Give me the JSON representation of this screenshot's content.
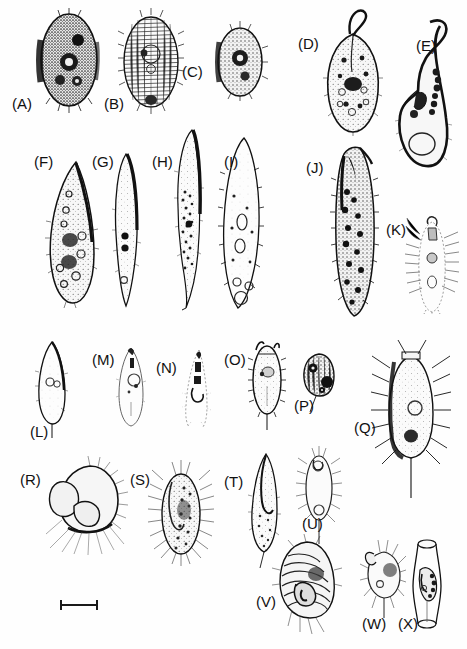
{
  "plate": {
    "title": "Plate of ciliate and flagellate protozoan line drawings",
    "caption": "",
    "background_color": "#ffffff",
    "ink_color": "#1a1a1a",
    "width": 467,
    "height": 649,
    "panel_count": 24
  },
  "scale_bar": {
    "name": "scale-bar",
    "x": 60,
    "y": 604,
    "length": 38,
    "label": ""
  },
  "panels": [
    {
      "id": "A",
      "label": "(A)",
      "label_x": 12,
      "label_y": 96,
      "fig_x": 36,
      "fig_y": 10,
      "fig_w": 66,
      "fig_h": 102,
      "shape": "oval-dark",
      "density": "very-dense",
      "cilia": "fringe-all",
      "tail": false
    },
    {
      "id": "B",
      "label": "(B)",
      "label_x": 104,
      "label_y": 96,
      "fig_x": 118,
      "fig_y": 12,
      "fig_w": 66,
      "fig_h": 100,
      "shape": "oval-striate",
      "density": "medium",
      "cilia": "fringe-all",
      "tail": false
    },
    {
      "id": "C",
      "label": "(C)",
      "label_x": 182,
      "label_y": 64,
      "fig_x": 212,
      "fig_y": 20,
      "fig_w": 56,
      "fig_h": 80,
      "shape": "oval-dark",
      "density": "dense",
      "cilia": "fringe-all",
      "tail": false
    },
    {
      "id": "D",
      "label": "(D)",
      "label_x": 298,
      "label_y": 36,
      "fig_x": 322,
      "fig_y": 8,
      "fig_w": 62,
      "fig_h": 128,
      "shape": "pear-hooked",
      "density": "dense",
      "cilia": "fine",
      "tail": false
    },
    {
      "id": "E",
      "label": "(E)",
      "label_x": 416,
      "label_y": 38,
      "fig_x": 392,
      "fig_y": 14,
      "fig_w": 62,
      "fig_h": 160,
      "shape": "flask-curved-neck",
      "density": "light",
      "cilia": "none",
      "tail": false
    },
    {
      "id": "F",
      "label": "(F)",
      "label_x": 34,
      "label_y": 154,
      "fig_x": 42,
      "fig_y": 158,
      "fig_w": 58,
      "fig_h": 150,
      "shape": "teardrop",
      "density": "dense",
      "cilia": "fringe-all",
      "tail": false
    },
    {
      "id": "G",
      "label": "(G)",
      "label_x": 92,
      "label_y": 154,
      "fig_x": 108,
      "fig_y": 150,
      "fig_w": 36,
      "fig_h": 160,
      "shape": "spindle-slim",
      "density": "light",
      "cilia": "fine",
      "tail": false
    },
    {
      "id": "H",
      "label": "(H)",
      "label_x": 152,
      "label_y": 154,
      "fig_x": 168,
      "fig_y": 128,
      "fig_w": 40,
      "fig_h": 182,
      "shape": "elongate-curved",
      "density": "granular",
      "cilia": "fine",
      "tail": true
    },
    {
      "id": "I",
      "label": "(I)",
      "label_x": 222,
      "label_y": 154,
      "fig_x": 214,
      "fig_y": 136,
      "fig_w": 54,
      "fig_h": 176,
      "shape": "spindle-vacuoles",
      "density": "light",
      "cilia": "spiky",
      "tail": false
    },
    {
      "id": "J",
      "label": "(J)",
      "label_x": 306,
      "label_y": 160,
      "fig_x": 330,
      "fig_y": 140,
      "fig_w": 50,
      "fig_h": 180,
      "shape": "cylindrical-hooked",
      "density": "very-dense",
      "cilia": "fringe-all",
      "tail": false
    },
    {
      "id": "K",
      "label": "(K)",
      "label_x": 386,
      "label_y": 222,
      "fig_x": 404,
      "fig_y": 214,
      "fig_w": 56,
      "fig_h": 100,
      "shape": "hypotrich-cirri",
      "density": "light",
      "cilia": "long-sparse",
      "tail": false
    },
    {
      "id": "L",
      "label": "(L)",
      "label_x": 30,
      "label_y": 424,
      "fig_x": 32,
      "fig_y": 340,
      "fig_w": 40,
      "fig_h": 90,
      "shape": "tear-stalked",
      "density": "light",
      "cilia": "fringe-all",
      "tail": true
    },
    {
      "id": "M",
      "label": "(M)",
      "label_x": 92,
      "label_y": 352,
      "fig_x": 114,
      "fig_y": 344,
      "fig_w": 34,
      "fig_h": 84,
      "shape": "oval-pointed",
      "density": "light",
      "cilia": "fine",
      "tail": false
    },
    {
      "id": "N",
      "label": "(N)",
      "label_x": 156,
      "label_y": 360,
      "fig_x": 180,
      "fig_y": 348,
      "fig_w": 32,
      "fig_h": 80,
      "shape": "cone-dotted",
      "density": "very-light",
      "cilia": "dotted",
      "tail": false
    },
    {
      "id": "O",
      "label": "(O)",
      "label_x": 224,
      "label_y": 352,
      "fig_x": 248,
      "fig_y": 338,
      "fig_w": 38,
      "fig_h": 92,
      "shape": "oval-stalked",
      "density": "medium",
      "cilia": "fringe-all",
      "tail": true
    },
    {
      "id": "P",
      "label": "(P)",
      "label_x": 294,
      "label_y": 398,
      "fig_x": 300,
      "fig_y": 352,
      "fig_w": 38,
      "fig_h": 48,
      "shape": "round-dark",
      "density": "dense",
      "cilia": "none",
      "tail": true
    },
    {
      "id": "Q",
      "label": "(Q)",
      "label_x": 354,
      "label_y": 420,
      "fig_x": 380,
      "fig_y": 348,
      "fig_w": 62,
      "fig_h": 130,
      "shape": "oval-radiate",
      "density": "medium",
      "cilia": "long-radiate",
      "tail": true
    },
    {
      "id": "R",
      "label": "(R)",
      "label_x": 20,
      "label_y": 472,
      "fig_x": 46,
      "fig_y": 462,
      "fig_w": 84,
      "fig_h": 86,
      "shape": "lobed-radiate",
      "density": "light",
      "cilia": "long-radiate",
      "tail": false
    },
    {
      "id": "S",
      "label": "(S)",
      "label_x": 130,
      "label_y": 472,
      "fig_x": 148,
      "fig_y": 460,
      "fig_w": 66,
      "fig_h": 106,
      "shape": "oval-hairy",
      "density": "dense",
      "cilia": "bristly",
      "tail": false
    },
    {
      "id": "T",
      "label": "(T)",
      "label_x": 224,
      "label_y": 474,
      "fig_x": 246,
      "fig_y": 452,
      "fig_w": 36,
      "fig_h": 106,
      "shape": "tear-hooked",
      "density": "granular",
      "cilia": "fine",
      "tail": true
    },
    {
      "id": "U",
      "label": "(U)",
      "label_x": 302,
      "label_y": 516,
      "fig_x": 300,
      "fig_y": 448,
      "fig_w": 38,
      "fig_h": 84,
      "shape": "oval-bristly",
      "density": "light",
      "cilia": "bristly",
      "tail": true
    },
    {
      "id": "V",
      "label": "(V)",
      "label_x": 256,
      "label_y": 594,
      "fig_x": 276,
      "fig_y": 540,
      "fig_w": 62,
      "fig_h": 82,
      "shape": "spiral-ridged",
      "density": "dense",
      "cilia": "ridged",
      "tail": true
    },
    {
      "id": "W",
      "label": "(W)",
      "label_x": 362,
      "label_y": 616,
      "fig_x": 362,
      "fig_y": 540,
      "fig_w": 44,
      "fig_h": 74,
      "shape": "peritrich-stalked",
      "density": "medium",
      "cilia": "long-sparse",
      "tail": true
    },
    {
      "id": "X",
      "label": "(X)",
      "label_x": 398,
      "label_y": 616,
      "fig_x": 410,
      "fig_y": 538,
      "fig_w": 34,
      "fig_h": 92,
      "shape": "lorica-vase",
      "density": "dense",
      "cilia": "none",
      "tail": false
    }
  ]
}
